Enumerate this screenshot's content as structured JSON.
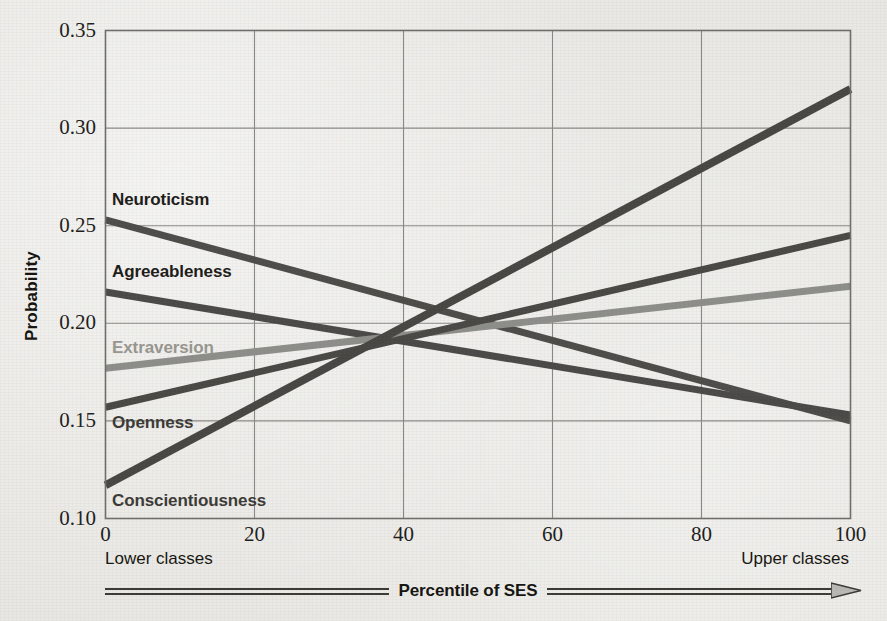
{
  "chart_data": {
    "type": "line",
    "title": "",
    "xlabel": "Percentile of SES",
    "ylabel": "Probability",
    "xlim": [
      0,
      100
    ],
    "ylim": [
      0.1,
      0.35
    ],
    "xticks": [
      "0",
      "20",
      "40",
      "60",
      "80",
      "100"
    ],
    "xtick_values": [
      0,
      20,
      40,
      60,
      80,
      100
    ],
    "yticks": [
      "0.10",
      "0.15",
      "0.20",
      "0.25",
      "0.30",
      "0.35"
    ],
    "ytick_values": [
      0.1,
      0.15,
      0.2,
      0.25,
      0.3,
      0.35
    ],
    "grid": true,
    "legend_position": "inline-labels-left",
    "x": [
      0,
      100
    ],
    "series": [
      {
        "name": "Neuroticism",
        "values": [
          0.253,
          0.15
        ],
        "color": "#4d4c49",
        "label_color": "#1c1b18",
        "width": 7
      },
      {
        "name": "Agreeableness",
        "values": [
          0.216,
          0.153
        ],
        "color": "#4a4947",
        "label_color": "#1c1b18",
        "width": 7
      },
      {
        "name": "Extraversion",
        "values": [
          0.177,
          0.219
        ],
        "color": "#8d8d89",
        "label_color": "#97968f",
        "width": 7
      },
      {
        "name": "Openness",
        "values": [
          0.157,
          0.245
        ],
        "color": "#494845",
        "label_color": "#3b3a36",
        "width": 7
      },
      {
        "name": "Conscientiousness",
        "values": [
          0.117,
          0.32
        ],
        "color": "#474643",
        "label_color": "#3b3a36",
        "width": 8
      }
    ],
    "annotations": {
      "x_axis_left_note": "Lower classes",
      "x_axis_right_note": "Upper classes"
    }
  },
  "figure": {
    "frame_color": "#6f6e6a",
    "grid_color": "#8a8985",
    "background_color": "#e8e7e3"
  }
}
